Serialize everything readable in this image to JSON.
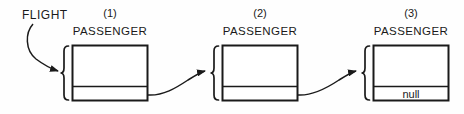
{
  "figure": {
    "background_color": "#fefefe",
    "stroke_color": "#1a1a1a",
    "pointer_label": "FLIGHT",
    "nodes": [
      {
        "index_label": "(1)",
        "type_label": "PASSENGER",
        "link_value": "",
        "box": {
          "x": 72,
          "y": 45,
          "w": 76,
          "h": 56,
          "divider_y": 86
        },
        "brace_x": 65
      },
      {
        "index_label": "(2)",
        "type_label": "PASSENGER",
        "link_value": "",
        "box": {
          "x": 222,
          "y": 45,
          "w": 76,
          "h": 56,
          "divider_y": 86
        },
        "brace_x": 215
      },
      {
        "index_label": "(3)",
        "type_label": "PASSENGER",
        "link_value": "null",
        "box": {
          "x": 373,
          "y": 45,
          "w": 76,
          "h": 56,
          "divider_y": 86
        },
        "brace_x": 366
      }
    ],
    "arrows": [
      {
        "name": "flight-to-node1",
        "from": "FLIGHT",
        "to": "(1)"
      },
      {
        "name": "node1-to-node2",
        "from": "(1)",
        "to": "(2)"
      },
      {
        "name": "node2-to-node3",
        "from": "(2)",
        "to": "(3)"
      }
    ]
  }
}
